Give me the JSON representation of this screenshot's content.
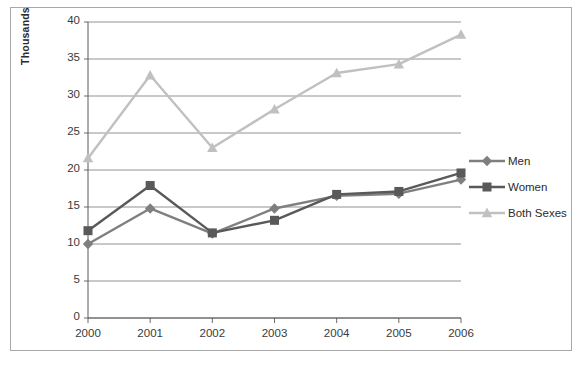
{
  "chart_data": {
    "type": "line",
    "title": "",
    "xlabel": "",
    "ylabel": "Thousands",
    "categories": [
      "2000",
      "2001",
      "2002",
      "2003",
      "2004",
      "2005",
      "2006"
    ],
    "ylim": [
      0,
      40
    ],
    "ytick_step": 5,
    "yticks": [
      "0",
      "5",
      "10",
      "15",
      "20",
      "25",
      "30",
      "35",
      "40"
    ],
    "grid": true,
    "legend_position": "right",
    "series": [
      {
        "name": "Men",
        "color": "#7f7f7f",
        "marker": "diamond",
        "values": [
          10.0,
          14.8,
          11.4,
          14.8,
          16.5,
          16.8,
          18.7
        ]
      },
      {
        "name": "Women",
        "color": "#595959",
        "marker": "square",
        "values": [
          11.8,
          17.9,
          11.5,
          13.2,
          16.7,
          17.1,
          19.6
        ]
      },
      {
        "name": "Both Sexes",
        "color": "#c0c0c0",
        "marker": "triangle",
        "values": [
          21.6,
          32.8,
          23.0,
          28.2,
          33.1,
          34.3,
          38.3
        ]
      }
    ]
  },
  "axis": {
    "y_title": "Thousands"
  },
  "legend": {
    "items": [
      {
        "label": "Men"
      },
      {
        "label": "Women"
      },
      {
        "label": "Both Sexes"
      }
    ]
  },
  "colors": {
    "men": "#7f7f7f",
    "women": "#595959",
    "both_sexes": "#c0c0c0",
    "gridline": "#868686",
    "axis": "#5a5a5a",
    "border": "#a8a8a8",
    "text": "#3a3a3a"
  }
}
